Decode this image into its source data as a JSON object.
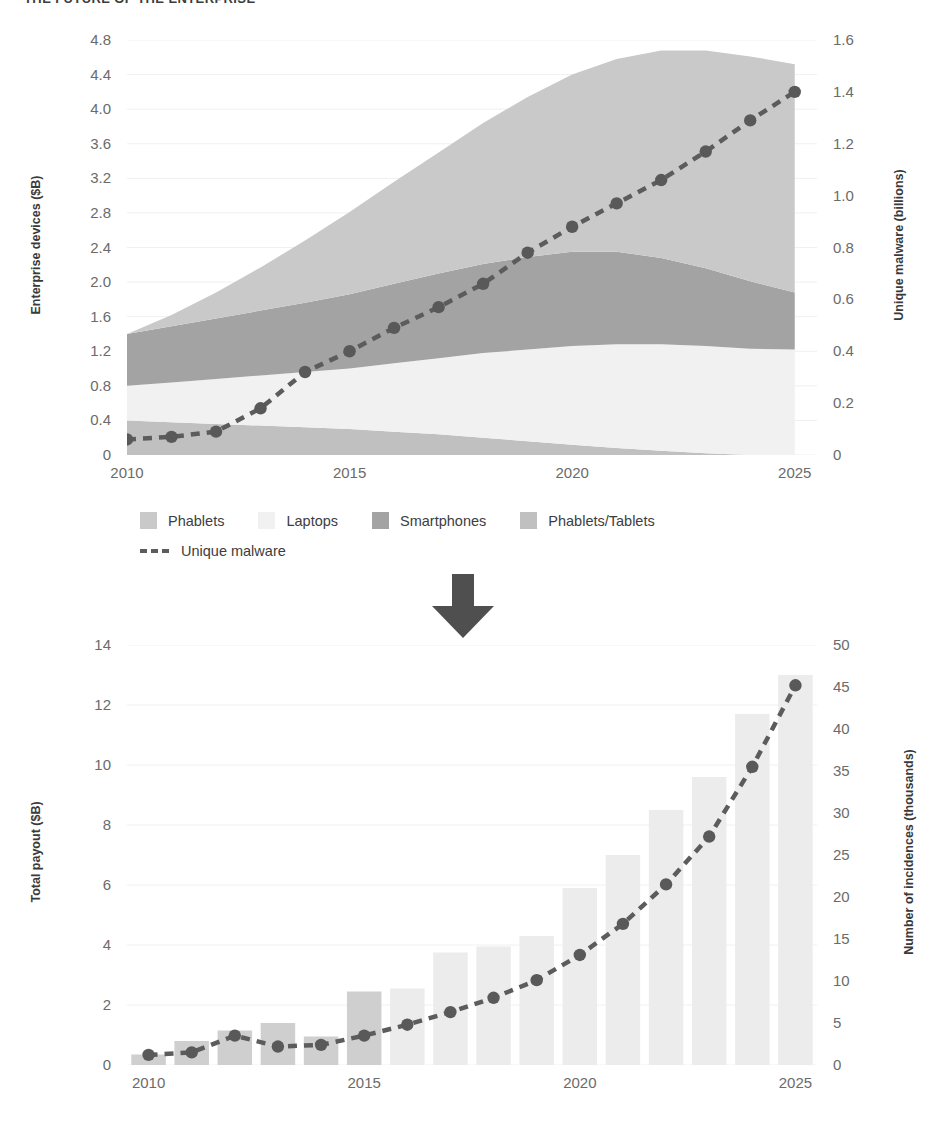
{
  "page": {
    "title": "THE FUTURE OF THE ENTERPRISE"
  },
  "colors": {
    "phablets": "#c9c9c9",
    "laptops": "#f1f1f1",
    "smartphones": "#a3a3a3",
    "phablets_tablets": "#c0c0c0",
    "bar_early": "#cfcfcf",
    "bar_late": "#ececec",
    "line": "#5c5c5c",
    "marker": "#595959",
    "grid": "#f0f0f0",
    "axis_text": "#6b6b6b",
    "label_text": "#3a3a3a",
    "arrow": "#4f4f4f"
  },
  "arrow": {
    "name": "down-arrow",
    "glyph": "⬇"
  },
  "chart_data": [
    {
      "id": "devices-malware",
      "type": "area",
      "title": "",
      "xlabel": "",
      "ylabel": "Enterprise devices ($B)",
      "y2label": "Unique malware (billions)",
      "grid": true,
      "legend_position": "bottom",
      "x": [
        2010,
        2011,
        2012,
        2013,
        2014,
        2015,
        2016,
        2017,
        2018,
        2019,
        2020,
        2021,
        2022,
        2023,
        2024,
        2025
      ],
      "xlim": [
        2010,
        2025.5
      ],
      "xticks": [
        "2010",
        "2015",
        "2020",
        "2025"
      ],
      "xtick_values": [
        2010,
        2015,
        2020,
        2025
      ],
      "ylim": [
        0,
        4.8
      ],
      "yticks": [
        "0",
        "0.4",
        "0.8",
        "1.2",
        "1.6",
        "2.0",
        "2.4",
        "2.8",
        "3.2",
        "3.6",
        "4.0",
        "4.4",
        "4.8"
      ],
      "ytick_values": [
        0,
        0.4,
        0.8,
        1.2,
        1.6,
        2.0,
        2.4,
        2.8,
        3.2,
        3.6,
        4.0,
        4.4,
        4.8
      ],
      "y2lim": [
        0,
        1.6
      ],
      "y2ticks": [
        "0",
        "0.2",
        "0.4",
        "0.6",
        "0.8",
        "1.0",
        "1.2",
        "1.4",
        "1.6"
      ],
      "y2tick_values": [
        0,
        0.2,
        0.4,
        0.6,
        0.8,
        1.0,
        1.2,
        1.4,
        1.6
      ],
      "stack_order": [
        "Phablets/Tablets",
        "Laptops",
        "Smartphones",
        "Phablets"
      ],
      "series": [
        {
          "name": "Phablets/Tablets",
          "color": "#c0c0c0",
          "values": [
            0.4,
            0.38,
            0.36,
            0.34,
            0.32,
            0.3,
            0.27,
            0.24,
            0.2,
            0.16,
            0.12,
            0.08,
            0.05,
            0.02,
            0.0,
            0.0
          ]
        },
        {
          "name": "Laptops",
          "color": "#f1f1f1",
          "values": [
            0.4,
            0.46,
            0.52,
            0.58,
            0.64,
            0.7,
            0.79,
            0.88,
            0.98,
            1.06,
            1.14,
            1.2,
            1.23,
            1.24,
            1.23,
            1.22
          ]
        },
        {
          "name": "Smartphones",
          "color": "#a3a3a3",
          "values": [
            0.6,
            0.65,
            0.7,
            0.75,
            0.8,
            0.86,
            0.92,
            0.98,
            1.03,
            1.07,
            1.09,
            1.07,
            1.0,
            0.9,
            0.78,
            0.66
          ]
        },
        {
          "name": "Phablets",
          "color": "#c9c9c9",
          "values": [
            0.0,
            0.13,
            0.3,
            0.5,
            0.72,
            0.95,
            1.18,
            1.4,
            1.63,
            1.85,
            2.05,
            2.23,
            2.4,
            2.52,
            2.6,
            2.64
          ]
        }
      ],
      "line_series": {
        "name": "Unique malware",
        "color": "#5c5c5c",
        "style": "dashed",
        "axis": "right",
        "values": [
          0.06,
          0.07,
          0.09,
          0.18,
          0.32,
          0.4,
          0.49,
          0.57,
          0.66,
          0.78,
          0.88,
          0.97,
          1.06,
          1.17,
          1.29,
          1.4
        ]
      }
    },
    {
      "id": "payout-incidences",
      "type": "bar",
      "title": "",
      "xlabel": "",
      "ylabel": "Total payout ($B)",
      "y2label": "Number of incidences (thousands)",
      "grid": true,
      "categories": [
        "2010",
        "2011",
        "2012",
        "2013",
        "2014",
        "2015",
        "2016",
        "2017",
        "2018",
        "2019",
        "2020",
        "2021",
        "2022",
        "2023",
        "2024",
        "2025"
      ],
      "xticks": [
        "2010",
        "2015",
        "2020",
        "2025"
      ],
      "xtick_values": [
        2010,
        2015,
        2020,
        2025
      ],
      "ylim": [
        0,
        14
      ],
      "yticks": [
        "0",
        "2",
        "4",
        "6",
        "8",
        "10",
        "12",
        "14"
      ],
      "ytick_values": [
        0,
        2,
        4,
        6,
        8,
        10,
        12,
        14
      ],
      "y2lim": [
        0,
        50
      ],
      "y2ticks": [
        "0",
        "5",
        "10",
        "15",
        "20",
        "25",
        "30",
        "35",
        "40",
        "45",
        "50"
      ],
      "y2tick_values": [
        0,
        5,
        10,
        15,
        20,
        25,
        30,
        35,
        40,
        45,
        50
      ],
      "bars": {
        "name": "Total payout",
        "values": [
          0.35,
          0.8,
          1.15,
          1.4,
          0.95,
          2.45,
          2.55,
          3.75,
          3.95,
          4.3,
          5.9,
          7.0,
          8.5,
          9.6,
          11.7,
          13.0
        ],
        "colors": [
          "#cfcfcf",
          "#cfcfcf",
          "#cfcfcf",
          "#cfcfcf",
          "#cfcfcf",
          "#cfcfcf",
          "#ececec",
          "#ececec",
          "#ececec",
          "#ececec",
          "#ececec",
          "#ececec",
          "#ececec",
          "#ececec",
          "#ececec",
          "#ececec"
        ]
      },
      "line_series": {
        "name": "Number of incidences",
        "color": "#5c5c5c",
        "style": "dashed",
        "axis": "right",
        "values": [
          1.2,
          1.5,
          3.5,
          2.2,
          2.4,
          3.5,
          4.8,
          6.3,
          8.0,
          10.1,
          13.1,
          16.8,
          21.5,
          27.2,
          35.5,
          45.2
        ]
      }
    }
  ],
  "legend": {
    "row1": [
      {
        "label": "Phablets",
        "color": "#c9c9c9"
      },
      {
        "label": "Laptops",
        "color": "#f1f1f1"
      },
      {
        "label": "Smartphones",
        "color": "#a3a3a3"
      },
      {
        "label": "Phablets/Tablets",
        "color": "#c0c0c0"
      }
    ],
    "row2": [
      {
        "label": "Unique malware",
        "color": "#5c5c5c"
      }
    ]
  }
}
